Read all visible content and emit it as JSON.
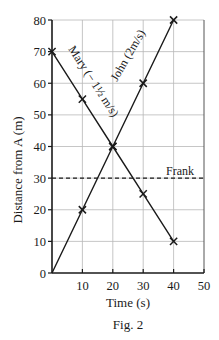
{
  "chart_data": {
    "type": "line",
    "title": "",
    "caption": "Fig. 2",
    "xlabel": "Time (s)",
    "ylabel": "Distance from A (m)",
    "xlim": [
      0,
      50
    ],
    "ylim": [
      0,
      80
    ],
    "xticks": [
      10,
      20,
      30,
      40,
      50
    ],
    "yticks": [
      0,
      10,
      20,
      30,
      40,
      50,
      60,
      70,
      80
    ],
    "grid": true,
    "legend": "none (inline line labels)",
    "series": [
      {
        "name": "John",
        "label": "John (2m/s)",
        "x": [
          0,
          10,
          20,
          30,
          40
        ],
        "y": [
          0,
          20,
          40,
          60,
          80
        ],
        "markers_at": [
          10,
          20,
          30,
          40
        ],
        "style": "solid",
        "marker": "x"
      },
      {
        "name": "Mary",
        "label": "Mary (−1½ m/s)",
        "x": [
          0,
          10,
          20,
          30,
          40
        ],
        "y": [
          70,
          55,
          40,
          25,
          10
        ],
        "markers_at": [
          0,
          10,
          20,
          30,
          40
        ],
        "style": "solid",
        "marker": "x"
      },
      {
        "name": "Frank",
        "label": "Frank",
        "x": [
          0,
          50
        ],
        "y": [
          30,
          30
        ],
        "style": "dashed",
        "marker": "none"
      }
    ]
  },
  "labels": {
    "xlabel": "Time (s)",
    "ylabel": "Distance from A (m)",
    "caption": "Fig. 2",
    "john": "John (2m/s)",
    "mary": "Mary (− 1½ m/s)",
    "frank": "Frank",
    "origin": "0"
  },
  "colors": {
    "line": "#1a1a1a",
    "grid": "#b8b8b8",
    "background": "#ffffff"
  }
}
